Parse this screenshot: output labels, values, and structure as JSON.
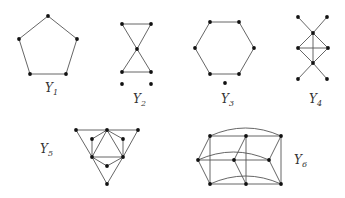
{
  "figure": {
    "graphs": [
      {
        "id": "Y1",
        "label": "Y",
        "subscript": "1",
        "description": "5-cycle (pentagon)",
        "vertices": 5,
        "edges": 5
      },
      {
        "id": "Y2",
        "label": "Y",
        "subscript": "2",
        "description": "bowtie (two triangles sharing a vertex) plus two isolated vertices",
        "vertices": 7,
        "edges": 6
      },
      {
        "id": "Y3",
        "label": "Y",
        "subscript": "3",
        "description": "6-cycle (hexagon) plus one isolated vertex",
        "vertices": 7,
        "edges": 6
      },
      {
        "id": "Y4",
        "label": "Y",
        "subscript": "4",
        "description": "complete graph K4 with two pendant edges at top and bottom vertices",
        "vertices": 8,
        "edges": 10
      },
      {
        "id": "Y5",
        "label": "Y",
        "subscript": "5",
        "description": "nested triangles graph",
        "vertices": 9,
        "edges": 17
      },
      {
        "id": "Y6",
        "label": "Y",
        "subscript": "6",
        "description": "3x3 prism-like grid graph with curved wrap edges",
        "vertices": 9,
        "edges": 18
      }
    ]
  }
}
